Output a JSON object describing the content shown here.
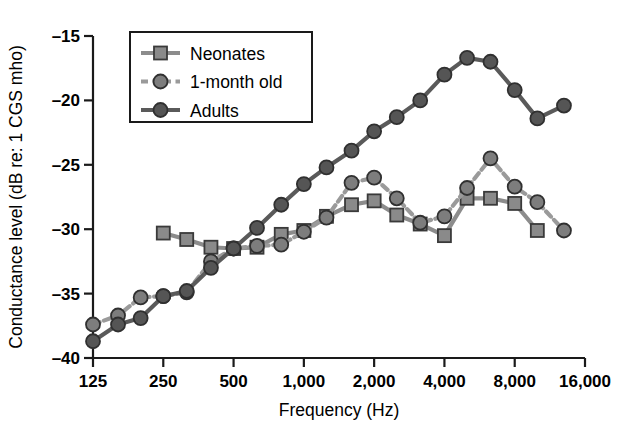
{
  "chart_data": {
    "type": "line",
    "title": "",
    "xlabel": "Frequency (Hz)",
    "ylabel": "Conductance level (dB re: 1 CGS mho)",
    "xscale": "log2",
    "xtick_labels": [
      "125",
      "250",
      "500",
      "1,000",
      "2,000",
      "4,000",
      "8,000",
      "16,000"
    ],
    "xtick_values": [
      125,
      250,
      500,
      1000,
      2000,
      4000,
      8000,
      16000
    ],
    "xlim": [
      125,
      16000
    ],
    "ytick_labels": [
      "–15",
      "–20",
      "–25",
      "–30",
      "–35",
      "–40"
    ],
    "ytick_values": [
      -15,
      -20,
      -25,
      -30,
      -35,
      -40
    ],
    "ylim": [
      -40,
      -15
    ],
    "grid": false,
    "legend_position": "top-left-inside",
    "series": [
      {
        "name": "Neonates",
        "marker": "square",
        "line_style": "solid",
        "color": "#8c8c8c",
        "marker_color": "#8a8a8a",
        "x": [
          250,
          315,
          400,
          500,
          630,
          800,
          1000,
          1250,
          1600,
          2000,
          2500,
          3150,
          4000,
          5000,
          6300,
          8000,
          10000
        ],
        "y": [
          -30.3,
          -30.8,
          -31.4,
          -31.5,
          -31.4,
          -30.4,
          -30.1,
          -29.0,
          -28.1,
          -27.8,
          -28.9,
          -29.6,
          -30.5,
          -27.6,
          -27.6,
          -28.0,
          -30.1
        ]
      },
      {
        "name": "1-month old",
        "marker": "circle",
        "line_style": "dashed",
        "color": "#9a9a9a",
        "marker_color": "#7d7d7d",
        "x": [
          125,
          160,
          200,
          250,
          315,
          400,
          500,
          630,
          800,
          1000,
          1250,
          1600,
          2000,
          2500,
          3150,
          4000,
          5000,
          6300,
          8000,
          10000,
          13000
        ],
        "y": [
          -37.4,
          -36.7,
          -35.3,
          -35.2,
          -34.9,
          -32.5,
          -31.5,
          -31.3,
          -31.2,
          -30.2,
          -29.1,
          -26.4,
          -26.0,
          -27.6,
          -29.5,
          -29.0,
          -26.8,
          -24.5,
          -26.7,
          -27.9,
          -30.1
        ]
      },
      {
        "name": "Adults",
        "marker": "circle",
        "line_style": "solid",
        "color": "#5a5a5a",
        "marker_color": "#555555",
        "x": [
          125,
          160,
          200,
          250,
          315,
          400,
          500,
          630,
          800,
          1000,
          1250,
          1600,
          2000,
          2500,
          3150,
          4000,
          5000,
          6300,
          8000,
          10000,
          13000
        ],
        "y": [
          -38.7,
          -37.4,
          -36.9,
          -35.2,
          -34.8,
          -33.0,
          -31.5,
          -29.9,
          -28.1,
          -26.5,
          -25.2,
          -23.9,
          -22.4,
          -21.3,
          -20.0,
          -18.0,
          -16.7,
          -17.0,
          -19.2,
          -21.4,
          -20.4
        ]
      }
    ],
    "legend": [
      {
        "label": "Neonates",
        "marker": "square",
        "line_style": "solid",
        "color": "#8c8c8c"
      },
      {
        "label": "1-month old",
        "marker": "circle",
        "line_style": "dashed",
        "color": "#9a9a9a"
      },
      {
        "label": "Adults",
        "marker": "circle",
        "line_style": "solid",
        "color": "#5a5a5a"
      }
    ]
  }
}
